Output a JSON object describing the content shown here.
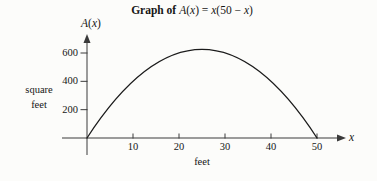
{
  "title": {
    "prefix": "Graph of",
    "math": [
      [
        "A",
        1
      ],
      [
        "(",
        0
      ],
      [
        "x",
        1
      ],
      [
        ") = ",
        0
      ],
      [
        "x",
        1
      ],
      [
        "(50 − ",
        0
      ],
      [
        "x",
        1
      ],
      [
        ")",
        0
      ]
    ]
  },
  "y_axis": {
    "name_math": [
      [
        "A",
        1
      ],
      [
        "(",
        0
      ],
      [
        "x",
        1
      ],
      [
        ")",
        0
      ]
    ],
    "unit_label_lines": [
      "square",
      "feet"
    ],
    "ticks": [
      200,
      400,
      600
    ]
  },
  "x_axis": {
    "name_math": [
      [
        "x",
        1
      ]
    ],
    "unit_label": "feet",
    "ticks": [
      10,
      20,
      30,
      40,
      50
    ]
  },
  "chart_data": {
    "type": "line",
    "xlabel": "feet",
    "ylabel": "square feet",
    "y_axis_name": "A(x)",
    "x_axis_name": "x",
    "x": [
      0,
      5,
      10,
      15,
      20,
      25,
      30,
      35,
      40,
      45,
      50
    ],
    "y": [
      0,
      225,
      400,
      525,
      600,
      625,
      600,
      525,
      400,
      225,
      0
    ],
    "peak": {
      "x": 25,
      "y": 625
    },
    "x_ticks": [
      10,
      20,
      30,
      40,
      50
    ],
    "y_ticks": [
      200,
      400,
      600
    ],
    "xlim": [
      0,
      55
    ],
    "ylim": [
      0,
      700
    ],
    "grid": false,
    "legend": "none",
    "curve_color": "#1b1b1b",
    "axis_color": "#3a3a3a",
    "text_color": "#161616",
    "background_color": "#fcfcfa"
  }
}
